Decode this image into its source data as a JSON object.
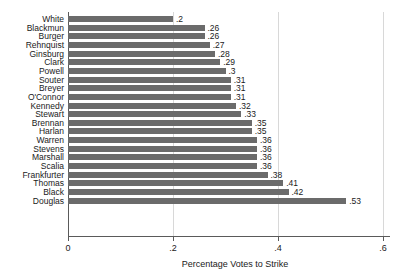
{
  "chart_data": {
    "type": "bar",
    "orientation": "horizontal",
    "title": "",
    "subtitle": "",
    "xlabel": "Percentage Votes to Strike",
    "ylabel": "",
    "xlim": [
      0,
      0.6
    ],
    "ylim": null,
    "grid": true,
    "grid_axis": "x",
    "legend": null,
    "legend_position": "none",
    "bar_color": "#6b6b6b",
    "axis_color": "#5a5a5a",
    "gridline_color": "#d8d8d8",
    "background_color": "#ffffff",
    "xticks": [
      0,
      0.2,
      0.4,
      0.6
    ],
    "xticklabels": [
      "0",
      ".2",
      ".4",
      ".6"
    ],
    "categories": [
      "White",
      "Blackmun",
      "Burger",
      "Rehnquist",
      "Ginsburg",
      "Clark",
      "Powell",
      "Souter",
      "Breyer",
      "O'Connor",
      "Kennedy",
      "Stewart",
      "Brennan",
      "Harlan",
      "Warren",
      "Stevens",
      "Marshall",
      "Scalia",
      "Frankfurter",
      "Thomas",
      "Black",
      "Douglas"
    ],
    "values": [
      0.2,
      0.26,
      0.26,
      0.27,
      0.28,
      0.29,
      0.3,
      0.31,
      0.31,
      0.31,
      0.32,
      0.33,
      0.35,
      0.35,
      0.36,
      0.36,
      0.36,
      0.36,
      0.38,
      0.41,
      0.42,
      0.53
    ],
    "value_labels": [
      ".2",
      ".26",
      ".26",
      ".27",
      ".28",
      ".29",
      ".3",
      ".31",
      ".31",
      ".31",
      ".32",
      ".33",
      ".35",
      ".35",
      ".36",
      ".36",
      ".36",
      ".36",
      ".38",
      ".41",
      ".42",
      ".53"
    ]
  }
}
